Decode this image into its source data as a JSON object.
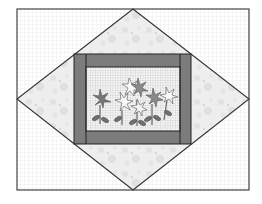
{
  "diagram": {
    "type": "quilt-block",
    "colors": {
      "background": "#ffffff",
      "grid": "#d8d8d8",
      "outline": "#3a3a3a",
      "floral_fabric": "#ececec",
      "frame": "#7a7a7a",
      "center_grid": "#b8b8b8",
      "flower_dark": "#6e6e6e",
      "flower_light": "#f4f4f4"
    },
    "outer_rect": {
      "x": 17,
      "y": 9,
      "w": 232,
      "h": 181
    },
    "diamond": {
      "top": [
        133,
        9
      ],
      "right": [
        249,
        99
      ],
      "bottom": [
        133,
        190
      ],
      "left": [
        17,
        99
      ]
    },
    "frame": {
      "x": 74,
      "y": 54,
      "w": 117,
      "h": 90,
      "bar": 12
    },
    "center_motif": "flowers"
  }
}
